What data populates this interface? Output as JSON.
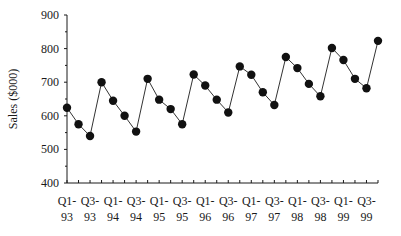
{
  "chart_data": {
    "type": "line",
    "title": "",
    "xlabel": "",
    "ylabel": "Sales ($000)",
    "ylim": [
      400,
      900
    ],
    "yticks": [
      400,
      500,
      600,
      700,
      800,
      900
    ],
    "grid": false,
    "legend": null,
    "categories": [
      "Q1-93",
      "Q2-93",
      "Q3-93",
      "Q4-93",
      "Q1-94",
      "Q2-94",
      "Q3-94",
      "Q4-94",
      "Q1-95",
      "Q2-95",
      "Q3-95",
      "Q4-95",
      "Q1-96",
      "Q2-96",
      "Q3-96",
      "Q4-96",
      "Q1-97",
      "Q2-97",
      "Q3-97",
      "Q4-97",
      "Q1-98",
      "Q2-98",
      "Q3-98",
      "Q4-98",
      "Q1-99",
      "Q2-99",
      "Q3-99",
      "Q4-99"
    ],
    "x_tick_labels": [
      {
        "index": 0,
        "line1": "Q1-",
        "line2": "93"
      },
      {
        "index": 2,
        "line1": "Q3-",
        "line2": "93"
      },
      {
        "index": 4,
        "line1": "Q1-",
        "line2": "94"
      },
      {
        "index": 6,
        "line1": "Q3-",
        "line2": "94"
      },
      {
        "index": 8,
        "line1": "Q1-",
        "line2": "95"
      },
      {
        "index": 10,
        "line1": "Q3-",
        "line2": "95"
      },
      {
        "index": 12,
        "line1": "Q1-",
        "line2": "96"
      },
      {
        "index": 14,
        "line1": "Q3-",
        "line2": "96"
      },
      {
        "index": 16,
        "line1": "Q1-",
        "line2": "97"
      },
      {
        "index": 18,
        "line1": "Q3-",
        "line2": "97"
      },
      {
        "index": 20,
        "line1": "Q1-",
        "line2": "98"
      },
      {
        "index": 22,
        "line1": "Q3-",
        "line2": "98"
      },
      {
        "index": 24,
        "line1": "Q1-",
        "line2": "99"
      },
      {
        "index": 26,
        "line1": "Q3-",
        "line2": "99"
      }
    ],
    "series": [
      {
        "name": "Sales",
        "marker": "circle",
        "values": [
          624,
          575,
          540,
          700,
          645,
          600,
          553,
          710,
          648,
          620,
          575,
          723,
          690,
          648,
          610,
          747,
          722,
          670,
          632,
          775,
          742,
          695,
          658,
          802,
          766,
          710,
          682,
          823
        ]
      }
    ]
  },
  "colors": {
    "axis": "#1a1a1a",
    "line": "#333333",
    "marker": "#111111",
    "background": "#ffffff"
  }
}
